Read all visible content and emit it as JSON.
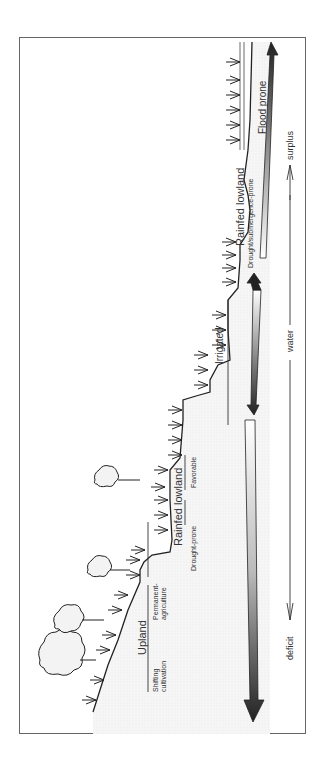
{
  "diagram": {
    "orientation": "rotated-90-ccw",
    "zones": [
      {
        "name": "Upland",
        "subzones": [
          "Shifting cultivation",
          "Permanent agriculture"
        ]
      },
      {
        "name": "Rainfed lowland",
        "subzones": [
          "Drought-prone",
          "Favorable"
        ]
      },
      {
        "name": "Irrigated",
        "subzones": []
      },
      {
        "name": "Rainfed lowland",
        "subzones": [
          "Drought/submergence-prone"
        ]
      },
      {
        "name": "Flood prone",
        "subzones": []
      }
    ],
    "labels": {
      "upland": "Upland",
      "shifting": "Shifting",
      "cultivation": "cultivation",
      "permanent": "Permanent-",
      "agriculture": "agriculture",
      "rainfed_lowland_1": "Rainfed lowland",
      "drought_prone": "Drought-prone",
      "favorable": "Favorable",
      "irrigated": "Irrigated",
      "rainfed_lowland_2": "Rainfed lowland",
      "drought_submergence": "Drought/submergence-prone",
      "flood_prone": "Flood prone"
    },
    "water_axis": {
      "deficit": "deficit",
      "water": "water",
      "surplus": "surplus"
    }
  }
}
